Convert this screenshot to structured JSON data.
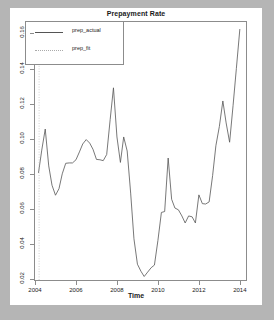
{
  "chart_data": {
    "type": "line",
    "title": "Prepayment Rate",
    "xlabel": "Time",
    "ylabel": "",
    "xlim": [
      2004.0,
      2014.3
    ],
    "ylim": [
      0.0195,
      0.1665
    ],
    "grid": false,
    "legend_position": "top-left",
    "xticks": [
      "2004",
      "2006",
      "2008",
      "2010",
      "2012",
      "2014"
    ],
    "xtick_values": [
      2004,
      2006,
      2008,
      2010,
      2012,
      2014
    ],
    "yticks": [
      "0.02",
      "0.04",
      "0.06",
      "0.08",
      "0.10",
      "0.12",
      "0.14",
      "0.16"
    ],
    "ytick_values": [
      0.02,
      0.04,
      0.06,
      0.08,
      0.1,
      0.12,
      0.14,
      0.16
    ],
    "series": [
      {
        "name": "prep_actual",
        "style": "solid",
        "color": "#555555",
        "x": [
          2004.17,
          2004.33,
          2004.5,
          2004.67,
          2004.83,
          2005.0,
          2005.17,
          2005.33,
          2005.5,
          2005.67,
          2005.83,
          2006.0,
          2006.17,
          2006.33,
          2006.5,
          2006.67,
          2006.83,
          2007.0,
          2007.17,
          2007.33,
          2007.5,
          2007.67,
          2007.83,
          2008.0,
          2008.17,
          2008.33,
          2008.5,
          2008.67,
          2008.83,
          2009.0,
          2009.17,
          2009.33,
          2009.5,
          2009.67,
          2009.83,
          2010.0,
          2010.17,
          2010.33,
          2010.5,
          2010.67,
          2010.83,
          2011.0,
          2011.17,
          2011.33,
          2011.5,
          2011.67,
          2011.83,
          2012.0,
          2012.17,
          2012.33,
          2012.5,
          2012.67,
          2012.83,
          2013.0,
          2013.17,
          2013.33,
          2013.5,
          2013.67,
          2013.83,
          2014.0
        ],
        "values": [
          0.0805,
          0.0935,
          0.1055,
          0.0845,
          0.0735,
          0.0678,
          0.0715,
          0.08,
          0.086,
          0.0862,
          0.0862,
          0.088,
          0.0925,
          0.097,
          0.0995,
          0.0975,
          0.094,
          0.0882,
          0.088,
          0.0875,
          0.091,
          0.111,
          0.129,
          0.101,
          0.0865,
          0.101,
          0.093,
          0.069,
          0.043,
          0.0285,
          0.0245,
          0.0215,
          0.024,
          0.0265,
          0.028,
          0.042,
          0.058,
          0.0585,
          0.089,
          0.0655,
          0.0605,
          0.0595,
          0.056,
          0.052,
          0.056,
          0.0555,
          0.052,
          0.068,
          0.063,
          0.0628,
          0.064,
          0.079,
          0.096,
          0.107,
          0.1215,
          0.109,
          0.098,
          0.119,
          0.14,
          0.1625
        ]
      },
      {
        "name": "prep_fit",
        "style": "dotted",
        "color": "#bbbbbb",
        "note": "vertical dotted reference line near 2004.2 spanning full plot height",
        "x": [
          2004.2,
          2004.2
        ],
        "values": [
          0.0195,
          0.1665
        ]
      }
    ]
  },
  "legend": {
    "items": [
      {
        "label": "prep_actual",
        "style": "solid"
      },
      {
        "label": "prep_fit",
        "style": "dotted"
      }
    ]
  }
}
